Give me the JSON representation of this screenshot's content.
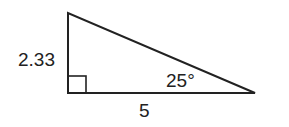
{
  "diagram": {
    "type": "right-triangle",
    "vertical_leg_label": "2.33",
    "horizontal_leg_label": "5",
    "angle_label": "25°",
    "right_angle_marker": true,
    "stroke_color": "#222222"
  }
}
